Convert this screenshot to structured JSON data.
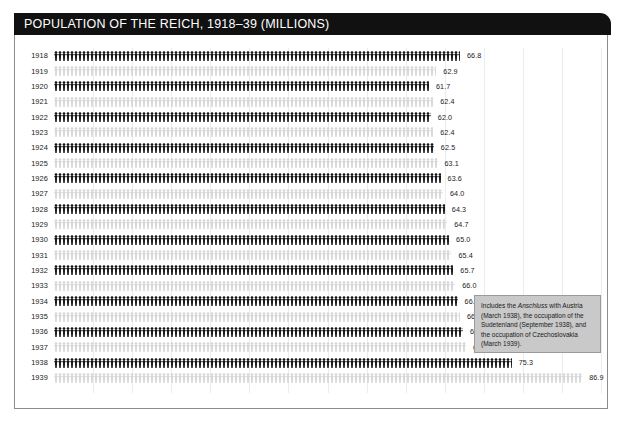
{
  "title": "POPULATION OF THE REICH, 1918–39 (MILLIONS)",
  "note": {
    "prefix": "Includes the ",
    "italic": "Anschluss",
    "suffix": " with Austria (March 1938), the occupation of the Sudetenland (September 1938), and the occupation of Czechoslovakia (March 1939)."
  },
  "colors": {
    "title_bar": "#111111",
    "bar_dark": "#111111",
    "bar_light": "#d6d6d6",
    "note_fill": "#c9c9c9",
    "note_border": "#9a9a9a",
    "frame_border": "#8c8c8c",
    "gridline": "#ececec",
    "text": "#1a1a1a",
    "background": "#ffffff"
  },
  "chart_data": {
    "type": "bar",
    "title": "POPULATION OF THE REICH, 1918–39 (MILLIONS)",
    "xlabel": "",
    "ylabel": "",
    "orientation": "horizontal",
    "unit": "millions",
    "pictogram": true,
    "grid": true,
    "legend": "none",
    "xlim": [
      0,
      90
    ],
    "categories": [
      "1918",
      "1919",
      "1920",
      "1921",
      "1922",
      "1923",
      "1924",
      "1925",
      "1926",
      "1927",
      "1928",
      "1929",
      "1930",
      "1931",
      "1932",
      "1933",
      "1934",
      "1935",
      "1936",
      "1937",
      "1938",
      "1939"
    ],
    "values": [
      66.8,
      62.9,
      61.7,
      62.4,
      62.0,
      62.4,
      62.5,
      63.1,
      63.6,
      64.0,
      64.3,
      64.7,
      65.0,
      65.4,
      65.7,
      66.0,
      66.4,
      66.8,
      67.3,
      67.8,
      75.3,
      86.9
    ],
    "value_labels": [
      "66.8",
      "62.9",
      "61.7",
      "62.4",
      "62.0",
      "62.4",
      "62.5",
      "63.1",
      "63.6",
      "64.0",
      "64.3",
      "64.7",
      "65.0",
      "65.4",
      "65.7",
      "66.0",
      "66.4",
      "66.8",
      "67.3",
      "67.8",
      "75.3",
      "86.9"
    ],
    "bar_styles": [
      "dark",
      "light",
      "dark",
      "light",
      "dark",
      "light",
      "dark",
      "light",
      "dark",
      "light",
      "dark",
      "light",
      "dark",
      "light",
      "dark",
      "light",
      "dark",
      "light",
      "dark",
      "light",
      "dark",
      "light"
    ],
    "annotations": [
      {
        "target": "1938",
        "text": "Includes the Anschluss with Austria (March 1938), the occupation of the Sudetenland (September 1938), and the occupation of Czechoslovakia (March 1939)."
      }
    ]
  }
}
